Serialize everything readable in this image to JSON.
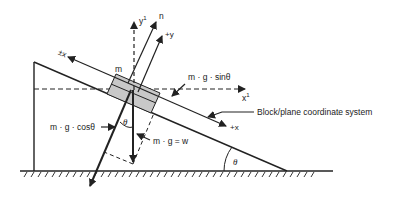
{
  "diagram": {
    "labels": {
      "mass": "m",
      "neg_x": "±x",
      "pos_x": "+x",
      "y_prime": "y",
      "y_prime_sup": "1",
      "x_prime": "x",
      "x_prime_sup": "1",
      "normal": "n",
      "pos_y": "+y",
      "sin_component": "m · g · sinθ",
      "cos_component": "m · g · cosθ",
      "weight": "m · g = w",
      "theta_block": "θ",
      "theta_incline": "θ",
      "coordinate_system": "Block/plane coordinate system"
    },
    "colors": {
      "line": "#222222",
      "block_fill": "#c8c8c8",
      "background": "#ffffff"
    }
  }
}
